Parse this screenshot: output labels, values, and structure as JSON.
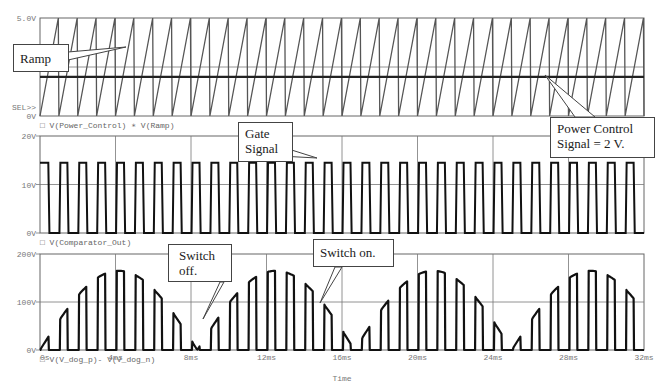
{
  "chart_data": [
    {
      "type": "line",
      "panel": "top",
      "title": "",
      "ylabel": "",
      "ylim": [
        0,
        5
      ],
      "ytick_labels": [
        "5.0V",
        "SEL>>",
        "0V"
      ],
      "legend": [
        "V(Power_Control)",
        "V(Ramp)"
      ],
      "series": [
        {
          "name": "V(Ramp)",
          "shape": "sawtooth",
          "min": 0,
          "max": 5,
          "period_ms": 1
        },
        {
          "name": "V(Power_Control)",
          "shape": "constant",
          "value": 2
        }
      ],
      "gridlines_y": [
        2.5
      ],
      "gridlines_x_ms": [
        4,
        8,
        12,
        16,
        20,
        24,
        28
      ]
    },
    {
      "type": "line",
      "panel": "middle",
      "ylim": [
        0,
        20
      ],
      "ytick_labels": [
        "20V",
        "10V",
        "0V"
      ],
      "legend": [
        "V(Comparator_Out)"
      ],
      "series": [
        {
          "name": "V(Comparator_Out)",
          "shape": "pulse",
          "low": 0,
          "high": 14.5,
          "period_ms": 1,
          "high_duration_ms": 0.45
        }
      ],
      "gridlines_y": [
        10
      ]
    },
    {
      "type": "line",
      "panel": "bottom",
      "ylim": [
        0,
        200
      ],
      "ytick_labels": [
        "200V",
        "100V",
        "0V"
      ],
      "xlabel": "Time",
      "xtick_labels": [
        "0s",
        "4ms",
        "8ms",
        "12ms",
        "16ms",
        "20ms",
        "24ms",
        "28ms",
        "32ms"
      ],
      "xlim_ms": [
        0,
        32
      ],
      "legend": [
        "V(V_dog_p)- V(V_dog_n)"
      ],
      "series": [
        {
          "name": "V(V_dog_p)- V(V_dog_n)",
          "shape": "gated rectified sine",
          "peak": 165,
          "envelope_period_ms": 8.333,
          "gate_period_ms": 1,
          "gate_on_ms": 0.45
        }
      ],
      "gridlines_y": [
        100
      ]
    }
  ],
  "callouts": {
    "ramp": "Ramp",
    "power_control": [
      "Power Control",
      "Signal = 2 V."
    ],
    "gate": [
      "Gate",
      "Signal"
    ],
    "switch_off": [
      "Switch",
      "off."
    ],
    "switch_on": "Switch on."
  },
  "axis": {
    "xlabel": "Time"
  }
}
